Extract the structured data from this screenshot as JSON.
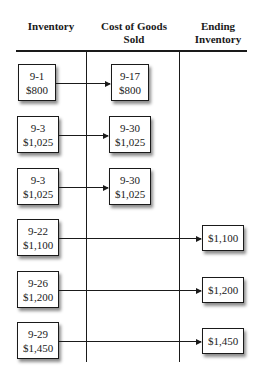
{
  "headers": {
    "inventory": "Inventory",
    "cogs": "Cost of Goods Sold",
    "ending": "Ending Inventory"
  },
  "rows": [
    {
      "purchase": {
        "date": "9-1",
        "cost": "$800"
      },
      "cogs": {
        "date": "9-17",
        "cost": "$800"
      }
    },
    {
      "purchase": {
        "date": "9-3",
        "cost": "$1,025"
      },
      "cogs": {
        "date": "9-30",
        "cost": "$1,025"
      }
    },
    {
      "purchase": {
        "date": "9-3",
        "cost": "$1,025"
      },
      "cogs": {
        "date": "9-30",
        "cost": "$1,025"
      }
    },
    {
      "purchase": {
        "date": "9-22",
        "cost": "$1,100"
      },
      "ending": {
        "cost": "$1,100"
      }
    },
    {
      "purchase": {
        "date": "9-26",
        "cost": "$1,200"
      },
      "ending": {
        "cost": "$1,200"
      }
    },
    {
      "purchase": {
        "date": "9-29",
        "cost": "$1,450"
      },
      "ending": {
        "cost": "$1,450"
      }
    }
  ]
}
